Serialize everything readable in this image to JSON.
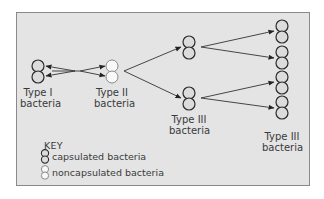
{
  "diagram": {
    "nodes": {
      "type1": {
        "line1": "Type I",
        "line2": "bacteria",
        "kind": "capsulated"
      },
      "type2": {
        "line1": "Type II",
        "line2": "bacteria",
        "kind": "noncapsulated"
      },
      "type3_mid": {
        "line1": "Type III",
        "line2": "bacteria",
        "kind": "capsulated"
      },
      "type3_right": {
        "line1": "Type III",
        "line2": "bacteria",
        "kind": "capsulated"
      }
    },
    "edges": [
      {
        "from": "type1",
        "to": "type2",
        "direction": "bidirectional"
      },
      {
        "from": "type2",
        "to": "type3_mid_top"
      },
      {
        "from": "type2",
        "to": "type3_mid_bottom"
      },
      {
        "from": "type3_mid_top",
        "to": "type3_right_pair1"
      },
      {
        "from": "type3_mid_top",
        "to": "type3_right_pair2"
      },
      {
        "from": "type3_mid_bottom",
        "to": "type3_right_pair3"
      },
      {
        "from": "type3_mid_bottom",
        "to": "type3_right_pair4"
      }
    ],
    "key": {
      "title": "KEY",
      "items": [
        {
          "icon": "capsulated-bacteria-icon",
          "label": "capsulated bacteria"
        },
        {
          "icon": "noncapsulated-bacteria-icon",
          "label": "noncapsulated bacteria"
        }
      ]
    },
    "colors": {
      "background": "#e4e4e4",
      "border": "#8a8a8a",
      "capsulated_stroke": "#2a2a2a",
      "capsulated_fill": "#dcdcdc",
      "noncapsulated_stroke": "#8a8a8a",
      "noncapsulated_fill": "#f8f8f8",
      "arrow": "#333333"
    }
  }
}
